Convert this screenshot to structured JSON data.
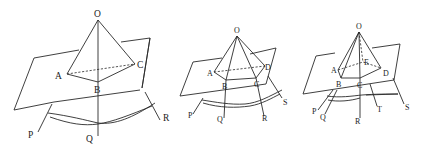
{
  "figures": [
    {
      "id": "fig1",
      "description": "Triangular pyramid O-ABC cut by a plane, with lines P, Q, R extending below",
      "labels": {
        "O": "O",
        "A": "A",
        "B": "B",
        "C": "C",
        "P": "P",
        "Q": "Q",
        "R": "R"
      }
    },
    {
      "id": "fig2",
      "description": "Quadrilateral pyramid O-ABCD cut by a plane, with lines P, Q, R, S extending below",
      "labels": {
        "O": "O",
        "A": "A",
        "B": "B",
        "C": "C",
        "D": "D",
        "P": "P",
        "Q": "Q",
        "R": "R",
        "S": "S"
      }
    },
    {
      "id": "fig3",
      "description": "Pentagonal pyramid O-ABCDE cut by a plane, with lines P, Q, R, T, S extending below",
      "labels": {
        "O": "O",
        "A": "A",
        "B": "B",
        "C": "C",
        "D": "D",
        "E": "E",
        "P": "P",
        "Q": "Q",
        "R": "R",
        "T": "T",
        "S": "S"
      }
    }
  ],
  "colors": {
    "stroke": "#2a2a2a",
    "background": "#ffffff"
  }
}
